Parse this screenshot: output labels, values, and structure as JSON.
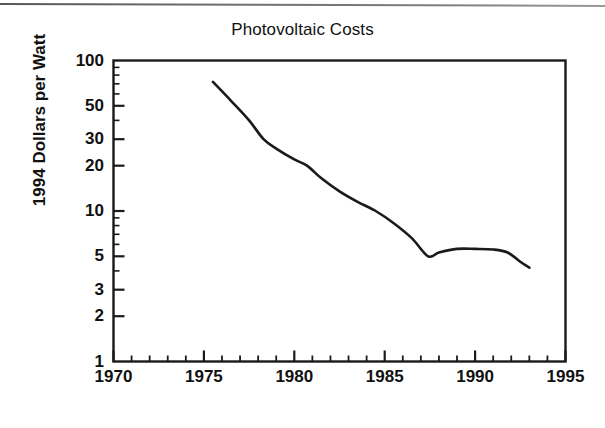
{
  "chart_data": {
    "type": "line",
    "title": "Photovoltaic Costs",
    "xlabel": "",
    "ylabel": "1994 Dollars per Watt",
    "yscale": "log",
    "xlim": [
      1970,
      1995
    ],
    "ylim": [
      1,
      100
    ],
    "grid": false,
    "legend": null,
    "x_ticks": [
      {
        "value": 1970,
        "label": "1970"
      },
      {
        "value": 1975,
        "label": "1975"
      },
      {
        "value": 1980,
        "label": "1980"
      },
      {
        "value": 1985,
        "label": "1985"
      },
      {
        "value": 1990,
        "label": "1990"
      },
      {
        "value": 1995,
        "label": "1995"
      }
    ],
    "x_minor_tick_interval": 1,
    "y_ticks": [
      {
        "value": 100,
        "label": "100"
      },
      {
        "value": 50,
        "label": "50"
      },
      {
        "value": 30,
        "label": "30"
      },
      {
        "value": 20,
        "label": "20"
      },
      {
        "value": 10,
        "label": "10"
      },
      {
        "value": 5,
        "label": "5"
      },
      {
        "value": 3,
        "label": "3"
      },
      {
        "value": 2,
        "label": "2"
      },
      {
        "value": 1,
        "label": "1"
      }
    ],
    "series": [
      {
        "name": "Photovoltaic module cost",
        "color": "#1a1a1a",
        "x": [
          1975.5,
          1976.5,
          1977.5,
          1978.3,
          1979.0,
          1980.0,
          1980.7,
          1981.5,
          1982.5,
          1983.5,
          1984.5,
          1985.5,
          1986.5,
          1987.4,
          1988.0,
          1989.0,
          1990.0,
          1991.0,
          1991.8,
          1992.5,
          1993.0
        ],
        "y": [
          72.0,
          54.0,
          40.0,
          30.0,
          26.0,
          22.0,
          20.0,
          16.5,
          13.5,
          11.5,
          10.0,
          8.3,
          6.6,
          5.0,
          5.3,
          5.6,
          5.6,
          5.55,
          5.3,
          4.6,
          4.2
        ]
      }
    ]
  },
  "figure": {
    "background": "#ffffff",
    "axis_color": "#1a1a1a"
  }
}
